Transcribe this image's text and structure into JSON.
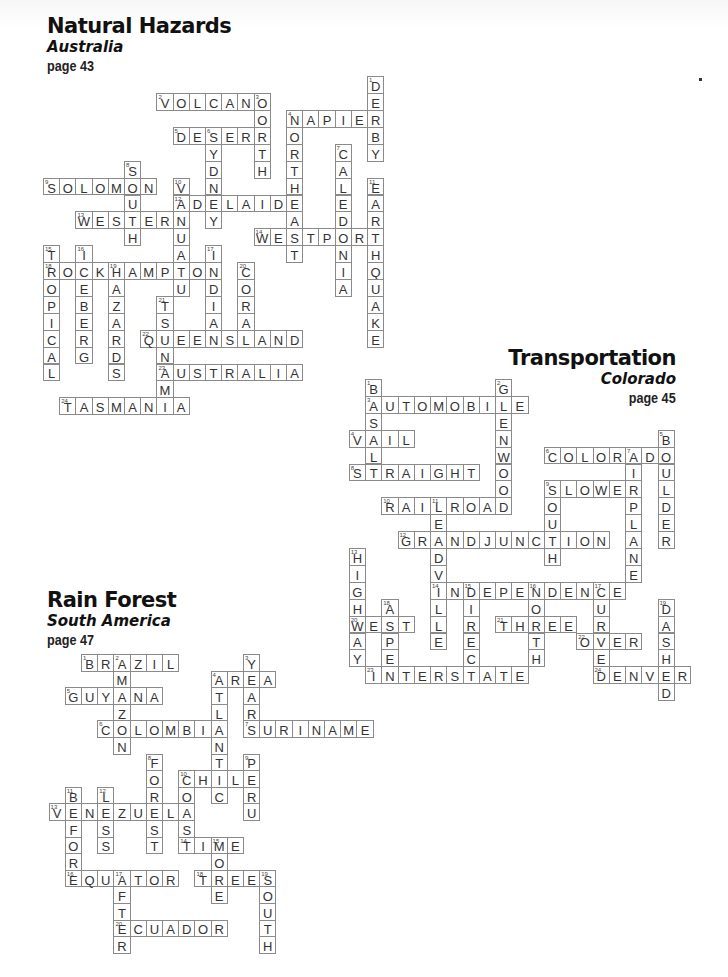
{
  "puzzles": [
    {
      "id": "australia",
      "title": "Natural Hazards",
      "subtitle": "Australia",
      "page": "page 43",
      "grid": {
        "x0": 43,
        "y0": 110,
        "dx": 16.2,
        "dy": 16.9
      },
      "words": [
        {
          "num": 1,
          "word": "DERBY",
          "dir": "down",
          "col": 20,
          "row": -2
        },
        {
          "num": 2,
          "word": "VOLCANO",
          "dir": "across",
          "col": 7,
          "row": -1
        },
        {
          "num": 3,
          "word": "NORTH",
          "dir": "down",
          "col": 13,
          "row": -1
        },
        {
          "num": 4,
          "word": "NAPIER",
          "dir": "across",
          "col": 15,
          "row": 0
        },
        {
          "num": 4,
          "word": "NORTHEAST",
          "dir": "down",
          "col": 15,
          "row": 0
        },
        {
          "num": 5,
          "word": "DESERT",
          "dir": "across",
          "col": 8,
          "row": 1
        },
        {
          "num": 6,
          "word": "SYDNEY",
          "dir": "down",
          "col": 10,
          "row": 1
        },
        {
          "num": 7,
          "word": "CALEDONIA",
          "dir": "down",
          "col": 18,
          "row": 2
        },
        {
          "num": 8,
          "word": "SOUTH",
          "dir": "down",
          "col": 5,
          "row": 3
        },
        {
          "num": 9,
          "word": "SOLOMON",
          "dir": "across",
          "col": 0,
          "row": 4
        },
        {
          "num": 10,
          "word": "VANUATU",
          "dir": "down",
          "col": 8,
          "row": 4
        },
        {
          "num": 11,
          "word": "EARTHQUAKE",
          "dir": "down",
          "col": 20,
          "row": 4
        },
        {
          "num": 12,
          "word": "ADELAIDE",
          "dir": "across",
          "col": 8,
          "row": 5
        },
        {
          "num": 13,
          "word": "WESTERN",
          "dir": "across",
          "col": 2,
          "row": 6
        },
        {
          "num": 14,
          "word": "WESTPORT",
          "dir": "across",
          "col": 13,
          "row": 7
        },
        {
          "num": 15,
          "word": "TROPICAL",
          "dir": "down",
          "col": 0,
          "row": 8
        },
        {
          "num": 16,
          "word": "ICEBERG",
          "dir": "down",
          "col": 2,
          "row": 8
        },
        {
          "num": 17,
          "word": "INDIAN",
          "dir": "down",
          "col": 10,
          "row": 8
        },
        {
          "num": 18,
          "word": "ROCKHAMPTON",
          "dir": "across",
          "col": 0,
          "row": 9
        },
        {
          "num": 19,
          "word": "HAZARDS",
          "dir": "down",
          "col": 4,
          "row": 9
        },
        {
          "num": 20,
          "word": "CORAL",
          "dir": "down",
          "col": 12,
          "row": 9
        },
        {
          "num": 21,
          "word": "TSUNAMI",
          "dir": "down",
          "col": 7,
          "row": 11
        },
        {
          "num": 22,
          "word": "QUEENSLAND",
          "dir": "across",
          "col": 6,
          "row": 13
        },
        {
          "num": 23,
          "word": "AUSTRALIA",
          "dir": "across",
          "col": 7,
          "row": 15
        },
        {
          "num": 24,
          "word": "TASMANIA",
          "dir": "across",
          "col": 1,
          "row": 17
        }
      ]
    },
    {
      "id": "colorado",
      "title": "Transportation",
      "subtitle": "Colorado",
      "page": "page 45",
      "grid": {
        "x0": 365,
        "y0": 379,
        "dx": 16.25,
        "dy": 16.9
      },
      "words": [
        {
          "num": 1,
          "word": "BASALT",
          "dir": "down",
          "col": 0,
          "row": 0
        },
        {
          "num": 2,
          "word": "GLENWOOD",
          "dir": "down",
          "col": 8,
          "row": 0
        },
        {
          "num": 3,
          "word": "AUTOMOBILE",
          "dir": "across",
          "col": 0,
          "row": 1
        },
        {
          "num": 4,
          "word": "VAIL",
          "dir": "across",
          "col": -1,
          "row": 3
        },
        {
          "num": 5,
          "word": "BOULDER",
          "dir": "down",
          "col": 18,
          "row": 3
        },
        {
          "num": 6,
          "word": "COLORADO",
          "dir": "across",
          "col": 11,
          "row": 4
        },
        {
          "num": 7,
          "word": "AIRPLANE",
          "dir": "down",
          "col": 16,
          "row": 4
        },
        {
          "num": 8,
          "word": "STRAIGHT",
          "dir": "across",
          "col": -1,
          "row": 5
        },
        {
          "num": 9,
          "word": "SLOWER",
          "dir": "across",
          "col": 11,
          "row": 6
        },
        {
          "num": 9,
          "word": "SOUTH",
          "dir": "down",
          "col": 11,
          "row": 6
        },
        {
          "num": 10,
          "word": "RAILROAD",
          "dir": "across",
          "col": 1,
          "row": 7
        },
        {
          "num": 11,
          "word": "LEADVILLE",
          "dir": "down",
          "col": 4,
          "row": 7
        },
        {
          "num": 12,
          "word": "GRANDJUNCTION",
          "dir": "across",
          "col": 2,
          "row": 9
        },
        {
          "num": 13,
          "word": "HIGHWAY",
          "dir": "down",
          "col": -1,
          "row": 10
        },
        {
          "num": 14,
          "word": "INDEPENDENCE",
          "dir": "across",
          "col": 4,
          "row": 12
        },
        {
          "num": 15,
          "word": "DIRECT",
          "dir": "down",
          "col": 6,
          "row": 12
        },
        {
          "num": 16,
          "word": "NORTH",
          "dir": "down",
          "col": 10,
          "row": 12
        },
        {
          "num": 17,
          "word": "CURVE",
          "dir": "down",
          "col": 14,
          "row": 12
        },
        {
          "num": 18,
          "word": "ASPEN",
          "dir": "down",
          "col": 1,
          "row": 13
        },
        {
          "num": 19,
          "word": "DASHED",
          "dir": "down",
          "col": 18,
          "row": 13
        },
        {
          "num": 20,
          "word": "WEST",
          "dir": "across",
          "col": -1,
          "row": 14
        },
        {
          "num": 21,
          "word": "THREE",
          "dir": "across",
          "col": 8,
          "row": 14
        },
        {
          "num": 22,
          "word": "OVER",
          "dir": "across",
          "col": 13,
          "row": 15
        },
        {
          "num": 23,
          "word": "INTERSTATE",
          "dir": "across",
          "col": 0,
          "row": 17
        },
        {
          "num": 24,
          "word": "DENVER",
          "dir": "across",
          "col": 14,
          "row": 17
        }
      ]
    },
    {
      "id": "south-america",
      "title": "Rain Forest",
      "subtitle": "South America",
      "page": "page 47",
      "grid": {
        "x0": 81,
        "y0": 654,
        "dx": 16.2,
        "dy": 16.6
      },
      "words": [
        {
          "num": 1,
          "word": "BRAZIL",
          "dir": "across",
          "col": 0,
          "row": 0
        },
        {
          "num": 2,
          "word": "AMAZON",
          "dir": "down",
          "col": 2,
          "row": 0
        },
        {
          "num": 3,
          "word": "YEARS",
          "dir": "down",
          "col": 10,
          "row": 0
        },
        {
          "num": 4,
          "word": "AREA",
          "dir": "across",
          "col": 8,
          "row": 1
        },
        {
          "num": 4,
          "word": "ATLANTIC",
          "dir": "down",
          "col": 8,
          "row": 1
        },
        {
          "num": 5,
          "word": "GUYANA",
          "dir": "across",
          "col": -1,
          "row": 2
        },
        {
          "num": 6,
          "word": "COLOMBIA",
          "dir": "across",
          "col": 1,
          "row": 4
        },
        {
          "num": 7,
          "word": "SURINAME",
          "dir": "across",
          "col": 10,
          "row": 4
        },
        {
          "num": 8,
          "word": "FOREST",
          "dir": "down",
          "col": 4,
          "row": 6
        },
        {
          "num": 9,
          "word": "PERU",
          "dir": "down",
          "col": 10,
          "row": 6
        },
        {
          "num": 10,
          "word": "CHILE",
          "dir": "across",
          "col": 6,
          "row": 7
        },
        {
          "num": 10,
          "word": "COAST",
          "dir": "down",
          "col": 6,
          "row": 7
        },
        {
          "num": 11,
          "word": "BEFORE",
          "dir": "down",
          "col": -1,
          "row": 8
        },
        {
          "num": 12,
          "word": "LESS",
          "dir": "down",
          "col": 1,
          "row": 8
        },
        {
          "num": 13,
          "word": "VENEZUELA",
          "dir": "across",
          "col": -2,
          "row": 9
        },
        {
          "num": 14,
          "word": "TIME",
          "dir": "across",
          "col": 6,
          "row": 11
        },
        {
          "num": 15,
          "word": "MORE",
          "dir": "down",
          "col": 8,
          "row": 11
        },
        {
          "num": 16,
          "word": "EQUATOR",
          "dir": "across",
          "col": -1,
          "row": 13
        },
        {
          "num": 17,
          "word": "AFTER",
          "dir": "down",
          "col": 2,
          "row": 13
        },
        {
          "num": 18,
          "word": "TREES",
          "dir": "across",
          "col": 7,
          "row": 13
        },
        {
          "num": 19,
          "word": "SOUTH",
          "dir": "down",
          "col": 11,
          "row": 13
        },
        {
          "num": 20,
          "word": "ECUADOR",
          "dir": "across",
          "col": 2,
          "row": 16
        }
      ]
    }
  ]
}
